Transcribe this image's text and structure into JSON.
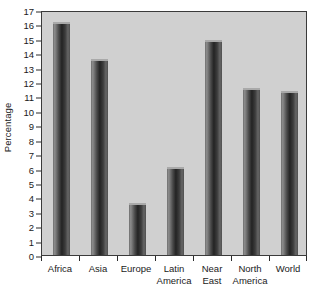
{
  "chart_data": {
    "type": "bar",
    "title": "",
    "subtitle": "",
    "xlabel": "",
    "ylabel": "Percentage",
    "ylim": [
      0,
      17
    ],
    "ytick_step": 1,
    "grid": false,
    "legend": false,
    "categories": [
      "Africa",
      "Asia",
      "Europe",
      "Latin America",
      "Near East",
      "North America",
      "World"
    ],
    "category_lines": [
      [
        "Africa",
        ""
      ],
      [
        "Asia",
        ""
      ],
      [
        "Europe",
        ""
      ],
      [
        "Latin",
        "America"
      ],
      [
        "Near",
        "East"
      ],
      [
        "North",
        "America"
      ],
      [
        "World",
        ""
      ]
    ],
    "values": [
      16.2,
      13.6,
      3.6,
      6.1,
      14.9,
      11.6,
      11.4
    ],
    "ytick_labels": [
      "0",
      "1",
      "2",
      "3",
      "4",
      "5",
      "6",
      "7",
      "8",
      "9",
      "10",
      "11",
      "12",
      "13",
      "14",
      "15",
      "16",
      "17"
    ]
  },
  "style": {
    "plot_background": "#d0d0d0",
    "page_background": "#ffffff",
    "axis_color": "#3a3a3a",
    "text_color": "#1a1a1a",
    "bar_dark": "#232323",
    "bar_light": "#8c8c8c",
    "bar_cap": "#a9a9a9"
  }
}
